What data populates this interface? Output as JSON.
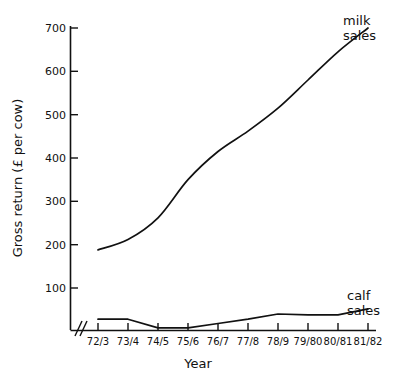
{
  "chart_data": {
    "type": "line",
    "title": "",
    "xlabel": "Year",
    "ylabel": "Gross return (£ per cow)",
    "categories": [
      "72/3",
      "73/4",
      "74/5",
      "75/6",
      "76/7",
      "77/8",
      "78/9",
      "79/80",
      "80/81",
      "81/82"
    ],
    "ylim": [
      0,
      700
    ],
    "yticks": [
      100,
      200,
      300,
      400,
      500,
      600,
      700
    ],
    "ytick_labels": [
      "100",
      "200",
      "300",
      "400",
      "500",
      "600",
      "700"
    ],
    "grid": false,
    "axis_break": "//",
    "legend_position": "inline-right-of-line-end",
    "series": [
      {
        "name": "milk sales",
        "label": "milk\nsales",
        "label_line1": "milk",
        "label_line2": "sales",
        "values": [
          188,
          212,
          262,
          350,
          415,
          462,
          515,
          580,
          645,
          700
        ]
      },
      {
        "name": "calf sales",
        "label": "calf\nsales",
        "label_line1": "calf",
        "label_line2": "sales",
        "values": [
          28,
          28,
          8,
          8,
          18,
          28,
          40,
          38,
          38,
          52
        ]
      }
    ]
  },
  "axes": {
    "y_title": "Gross return (£ per cow)",
    "x_title": "Year",
    "y_labels": [
      "700",
      "600",
      "500",
      "400",
      "300",
      "200",
      "100"
    ],
    "x_labels": [
      "72/3",
      "73/4",
      "74/5",
      "75/6",
      "76/7",
      "77/8",
      "78/9",
      "79/80",
      "80/81",
      "81/82"
    ]
  },
  "labels": {
    "milk_line1": "milk",
    "milk_line2": "sales",
    "calf_line1": "calf",
    "calf_line2": "sales"
  },
  "colors": {
    "line": "#111111",
    "background": "#ffffff",
    "text": "#111111"
  }
}
